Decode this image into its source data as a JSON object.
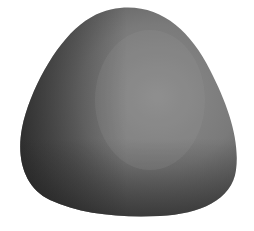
{
  "image": {
    "subject": "smooth rounded gray stone",
    "background_color": "#ffffff",
    "colors": {
      "stone_light": "#8a8a8a",
      "stone_mid": "#6e6e6e",
      "stone_dark": "#2e2e2e"
    }
  }
}
